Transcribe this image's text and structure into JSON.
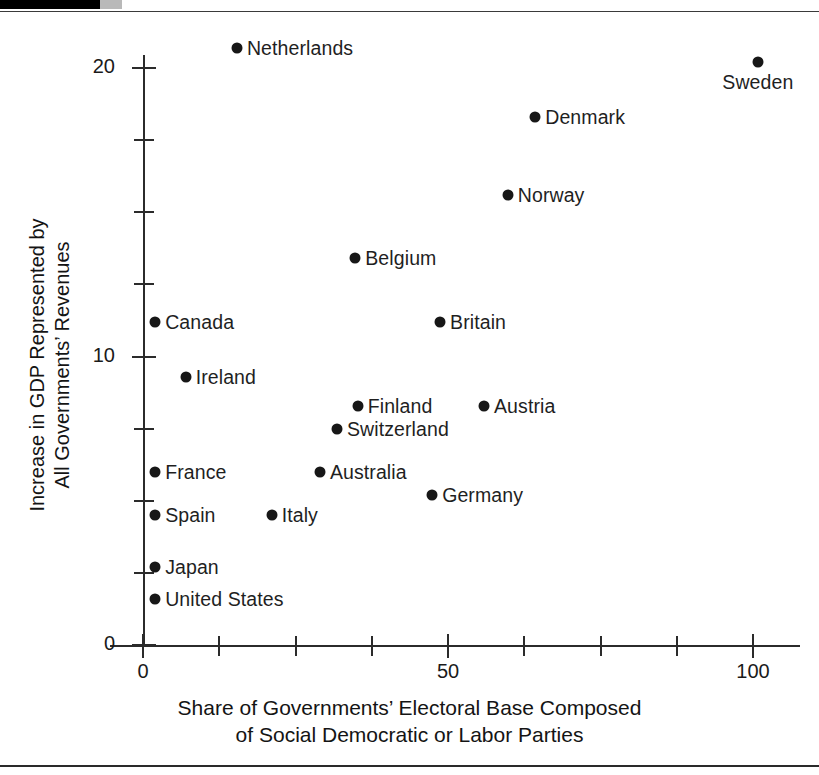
{
  "figure": {
    "background": "#ffffff",
    "point_color": "#171717",
    "axis_color": "#2b2b2b",
    "has_top_rule": true,
    "has_bottom_rule": true
  },
  "chart_data": {
    "type": "scatter",
    "title": "",
    "xlabel_line1": "Share of Governments’ Electoral Base Composed",
    "xlabel_line2": "of Social Democratic or Labor Parties",
    "ylabel_line1": "Increase in GDP Represented by",
    "ylabel_line2": "All Governments’ Revenues",
    "xlim": [
      0,
      107
    ],
    "ylim": [
      0,
      21
    ],
    "grid": false,
    "legend": "none",
    "x_ticks_major": [
      0,
      50,
      100
    ],
    "x_tick_labels": [
      "0",
      "50",
      "100"
    ],
    "x_ticks_minor": [
      12.5,
      25,
      37.5,
      62.5,
      75,
      87.5
    ],
    "y_ticks_major": [
      0,
      10,
      20
    ],
    "y_tick_labels": [
      "0",
      "10",
      "20"
    ],
    "y_ticks_minor": [
      2.5,
      5,
      7.5,
      12.5,
      15,
      17.5
    ],
    "points": [
      {
        "label": "Netherlands",
        "x": 15.4,
        "y": 20.7,
        "label_pos": "right"
      },
      {
        "label": "Sweden",
        "x": 100.8,
        "y": 20.2,
        "label_pos": "below"
      },
      {
        "label": "Denmark",
        "x": 64.3,
        "y": 18.3,
        "label_pos": "right"
      },
      {
        "label": "Norway",
        "x": 59.8,
        "y": 15.6,
        "label_pos": "right"
      },
      {
        "label": "Belgium",
        "x": 34.8,
        "y": 13.4,
        "label_pos": "right"
      },
      {
        "label": "Canada",
        "x": 2.0,
        "y": 11.2,
        "label_pos": "right"
      },
      {
        "label": "Britain",
        "x": 48.7,
        "y": 11.2,
        "label_pos": "right"
      },
      {
        "label": "Ireland",
        "x": 7.0,
        "y": 9.3,
        "label_pos": "right"
      },
      {
        "label": "Finland",
        "x": 35.2,
        "y": 8.3,
        "label_pos": "right"
      },
      {
        "label": "Austria",
        "x": 55.9,
        "y": 8.3,
        "label_pos": "right"
      },
      {
        "label": "Switzerland",
        "x": 31.8,
        "y": 7.5,
        "label_pos": "right"
      },
      {
        "label": "France",
        "x": 2.0,
        "y": 6.0,
        "label_pos": "right"
      },
      {
        "label": "Australia",
        "x": 29.0,
        "y": 6.0,
        "label_pos": "right"
      },
      {
        "label": "Germany",
        "x": 47.4,
        "y": 5.2,
        "label_pos": "right"
      },
      {
        "label": "Spain",
        "x": 2.0,
        "y": 4.5,
        "label_pos": "right"
      },
      {
        "label": "Italy",
        "x": 21.1,
        "y": 4.5,
        "label_pos": "right"
      },
      {
        "label": "Japan",
        "x": 2.0,
        "y": 2.7,
        "label_pos": "right"
      },
      {
        "label": "United States",
        "x": 2.0,
        "y": 1.6,
        "label_pos": "right"
      }
    ]
  }
}
